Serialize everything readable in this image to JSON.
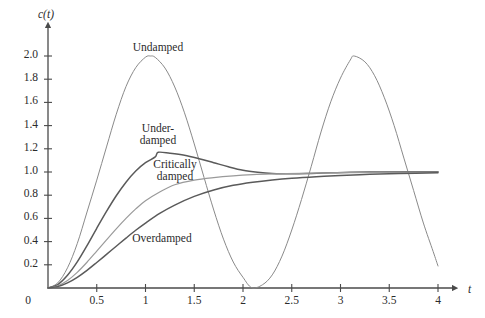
{
  "figure": {
    "background_color": "#ffffff",
    "axis_color": "#4a4a4a"
  },
  "axes": {
    "y_axis_title": "c(t)",
    "x_axis_title": "t",
    "x_ticks": [
      "0",
      "0.5",
      "1",
      "1.5",
      "2",
      "2.5",
      "3",
      "3.5",
      "4"
    ],
    "y_ticks": [
      "0",
      "0.2",
      "0.4",
      "0.6",
      "0.8",
      "1.0",
      "1.2",
      "1.4",
      "1.6",
      "1.8",
      "2.0"
    ],
    "origin_label": "0"
  },
  "curve_labels": {
    "undamped": "Undamped",
    "underdamped_line1": "Under-",
    "underdamped_line2": "damped",
    "critically_line1": "Critically",
    "critically_line2": "damped",
    "overdamped": "Overdamped"
  },
  "chart_data": {
    "type": "line",
    "title": "",
    "subtitle": "",
    "xlabel": "t",
    "ylabel": "c(t)",
    "xlim": [
      0,
      4.0
    ],
    "ylim": [
      0,
      2.15
    ],
    "xticks": [
      0,
      0.5,
      1,
      1.5,
      2,
      2.5,
      3,
      3.5,
      4
    ],
    "yticks": [
      0,
      0.2,
      0.4,
      0.6,
      0.8,
      1.0,
      1.2,
      1.4,
      1.6,
      1.8,
      2.0
    ],
    "grid": false,
    "legend": "inline-annotations",
    "annotations": [
      {
        "text": "Undamped",
        "x": 1.05,
        "y": 2.12
      },
      {
        "text": "Under-damped",
        "x": 1.07,
        "y": 1.4
      },
      {
        "text": "Critically damped",
        "x": 1.3,
        "y": 1.15
      },
      {
        "text": "Overdamped",
        "x": 1.35,
        "y": 0.47
      }
    ],
    "series": [
      {
        "name": "Undamped",
        "color": "#8a8a8a",
        "width": 1.0,
        "description": "1 - cos(3t); zeta = 0; peak 2.0 at t=1.05, zero at t=2.09, second peak 2.0 at t=3.14",
        "points": [
          [
            0.0,
            0.0
          ],
          [
            0.1,
            0.044
          ],
          [
            0.2,
            0.174
          ],
          [
            0.3,
            0.383
          ],
          [
            0.4,
            0.655
          ],
          [
            0.5,
            0.93
          ],
          [
            0.6,
            1.216
          ],
          [
            0.7,
            1.498
          ],
          [
            0.8,
            1.737
          ],
          [
            0.9,
            1.9
          ],
          [
            1.0,
            1.99
          ],
          [
            1.05,
            2.0
          ],
          [
            1.1,
            1.988
          ],
          [
            1.2,
            1.896
          ],
          [
            1.3,
            1.733
          ],
          [
            1.4,
            1.51
          ],
          [
            1.5,
            1.242
          ],
          [
            1.6,
            0.954
          ],
          [
            1.7,
            0.672
          ],
          [
            1.8,
            0.421
          ],
          [
            1.9,
            0.224
          ],
          [
            2.0,
            0.092
          ],
          [
            2.09,
            0.003
          ],
          [
            2.2,
            0.028
          ],
          [
            2.3,
            0.113
          ],
          [
            2.4,
            0.275
          ],
          [
            2.5,
            0.5
          ],
          [
            2.6,
            0.763
          ],
          [
            2.7,
            1.049
          ],
          [
            2.8,
            1.345
          ],
          [
            2.9,
            1.605
          ],
          [
            3.0,
            1.81
          ],
          [
            3.1,
            1.965
          ],
          [
            3.14,
            2.0
          ],
          [
            3.25,
            1.95
          ],
          [
            3.35,
            1.83
          ],
          [
            3.45,
            1.64
          ],
          [
            3.55,
            1.4
          ],
          [
            3.65,
            1.12
          ],
          [
            3.75,
            0.84
          ],
          [
            3.85,
            0.56
          ],
          [
            3.95,
            0.315
          ],
          [
            4.0,
            0.19
          ]
        ]
      },
      {
        "name": "Underdamped",
        "color": "#5a5a5a",
        "width": 1.5,
        "description": "zeta ~ 0.3; overshoot to 1.17 at t~1.13, settles to 1.0",
        "points": [
          [
            0.0,
            0.0
          ],
          [
            0.1,
            0.03
          ],
          [
            0.2,
            0.11
          ],
          [
            0.3,
            0.225
          ],
          [
            0.4,
            0.365
          ],
          [
            0.5,
            0.515
          ],
          [
            0.6,
            0.66
          ],
          [
            0.7,
            0.795
          ],
          [
            0.8,
            0.912
          ],
          [
            0.9,
            1.008
          ],
          [
            1.0,
            1.08
          ],
          [
            1.1,
            1.13
          ],
          [
            1.13,
            1.17
          ],
          [
            1.25,
            1.162
          ],
          [
            1.4,
            1.145
          ],
          [
            1.55,
            1.115
          ],
          [
            1.7,
            1.08
          ],
          [
            1.85,
            1.045
          ],
          [
            2.0,
            1.015
          ],
          [
            2.15,
            0.998
          ],
          [
            2.3,
            0.988
          ],
          [
            2.5,
            0.985
          ],
          [
            2.7,
            0.988
          ],
          [
            2.9,
            0.993
          ],
          [
            3.1,
            0.997
          ],
          [
            3.4,
            1.0
          ],
          [
            3.7,
            1.002
          ],
          [
            4.0,
            1.003
          ]
        ]
      },
      {
        "name": "Critically damped",
        "color": "#9a9a9a",
        "width": 1.2,
        "description": "zeta = 1; no overshoot, rises to 1.0 asymptotically",
        "points": [
          [
            0.0,
            0.0
          ],
          [
            0.1,
            0.018
          ],
          [
            0.2,
            0.065
          ],
          [
            0.3,
            0.135
          ],
          [
            0.4,
            0.222
          ],
          [
            0.5,
            0.318
          ],
          [
            0.6,
            0.415
          ],
          [
            0.7,
            0.51
          ],
          [
            0.8,
            0.6
          ],
          [
            0.9,
            0.682
          ],
          [
            1.0,
            0.752
          ],
          [
            1.15,
            0.83
          ],
          [
            1.3,
            0.89
          ],
          [
            1.5,
            0.93
          ],
          [
            1.7,
            0.952
          ],
          [
            1.9,
            0.967
          ],
          [
            2.1,
            0.977
          ],
          [
            2.3,
            0.983
          ],
          [
            2.6,
            0.989
          ],
          [
            3.0,
            0.994
          ],
          [
            3.4,
            0.997
          ],
          [
            3.7,
            0.999
          ],
          [
            4.0,
            1.0
          ]
        ]
      },
      {
        "name": "Overdamped",
        "color": "#5a5a5a",
        "width": 1.5,
        "description": "zeta > 1; slowest rise, approaches 1.0 from below",
        "points": [
          [
            0.0,
            0.0
          ],
          [
            0.1,
            0.012
          ],
          [
            0.2,
            0.044
          ],
          [
            0.3,
            0.092
          ],
          [
            0.4,
            0.152
          ],
          [
            0.5,
            0.22
          ],
          [
            0.6,
            0.29
          ],
          [
            0.7,
            0.36
          ],
          [
            0.8,
            0.43
          ],
          [
            0.9,
            0.498
          ],
          [
            1.0,
            0.56
          ],
          [
            1.15,
            0.645
          ],
          [
            1.3,
            0.715
          ],
          [
            1.5,
            0.79
          ],
          [
            1.7,
            0.845
          ],
          [
            1.9,
            0.885
          ],
          [
            2.1,
            0.912
          ],
          [
            2.3,
            0.932
          ],
          [
            2.5,
            0.947
          ],
          [
            2.75,
            0.96
          ],
          [
            3.0,
            0.97
          ],
          [
            3.3,
            0.98
          ],
          [
            3.6,
            0.987
          ],
          [
            4.0,
            0.994
          ]
        ]
      }
    ]
  }
}
